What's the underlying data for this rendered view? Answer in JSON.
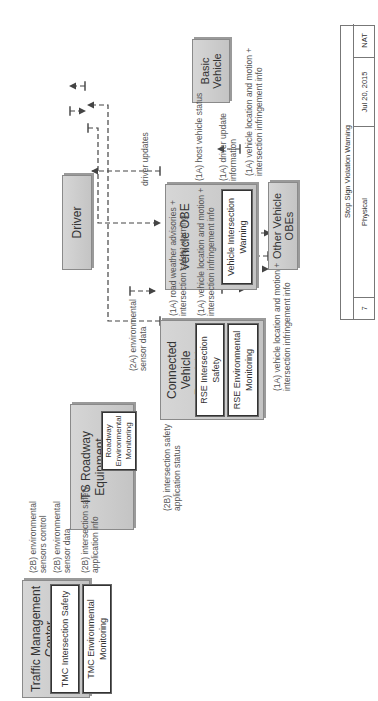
{
  "diagram": {
    "title_block": {
      "title": "Stop Sign Violation Warning",
      "number": "7",
      "view": "Physical",
      "date": "Jul 20, 2015",
      "author": "NAT"
    },
    "nodes": {
      "tmc": {
        "title": "Traffic Management Center",
        "subsystems": [
          "TMC Intersection Safety",
          "TMC Environmental Monitoring"
        ]
      },
      "its_roadway": {
        "title": "ITS Roadway Equipment",
        "subsystems": [
          "Roadway Environmental Monitoring"
        ]
      },
      "rse": {
        "title": "Connected Vehicle Roadside Equipment",
        "subsystems": [
          "RSE Intersection Safety",
          "RSE Environmental Monitoring"
        ]
      },
      "vehicle_obe": {
        "title": "Vehicle OBE",
        "subsystems": [
          "Vehicle Intersection Warning"
        ]
      },
      "driver": {
        "title": "Driver"
      },
      "basic_vehicle": {
        "title": "Basic Vehicle"
      },
      "other_obes": {
        "title": "Other Vehicle OBEs"
      }
    },
    "flows": {
      "env_sensors_control": "(2B) environmental\nsensors control",
      "env_sensor_data_2b": "(2B) environmental\nsensor data",
      "isect_safety_app_info": "(2B) intersection safety\napplication info",
      "isect_safety_app_status": "(2B) intersection safety\napplication status",
      "env_sensor_data_2a": "(2A) environmental\nsensor data",
      "road_weather_advisories": "(1A) road weather advisories +\nintersection safety warning",
      "veh_loc_motion_rse": "(1A) vehicle location and motion +\nintersection infringement info",
      "driver_updates": "driver updates",
      "host_vehicle_status": "(1A) host vehicle status",
      "driver_update_info": "(1A) driver update\ninformation",
      "veh_loc_motion_out": "(1A) vehicle location and motion +\nintersection infringement info",
      "veh_loc_motion_in": "(1A) vehicle location and motion +\nintersection infringement info"
    },
    "colors": {
      "box_fill": "#cccccc",
      "box_border": "#8a8a8a",
      "line": "#444444",
      "text": "#333333"
    }
  }
}
